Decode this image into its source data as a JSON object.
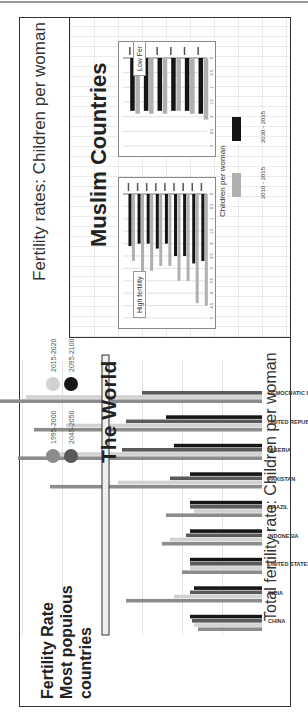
{
  "slide": {
    "right_title": "Fertility rates: Children per woman",
    "left_title_lines": [
      "Fertility Rate",
      "Most    populous",
      "countries"
    ],
    "world_title": "The World",
    "bottom_label": "Total fertility rate: Children per woman"
  },
  "muslim_panel": {
    "title": "Muslim Countries",
    "high_tag": "High fertility",
    "low_tag": "Low Fer",
    "legend_title": "Children per woman",
    "legend": [
      {
        "label": "2010 - 2015",
        "color": "#b0b0b0"
      },
      {
        "label": "2030 - 2035",
        "color": "#141414"
      }
    ]
  },
  "chart_data": [
    {
      "type": "bar",
      "title": "The World",
      "ylabel": "Total fertility rate: Children per woman",
      "ylim": [
        0,
        7
      ],
      "grid": true,
      "legend_position": "top-left",
      "categories": [
        "CHINA",
        "INDIA",
        "UNITED STATES",
        "INDONESIA",
        "BRAZIL",
        "PAKISTAN",
        "NIGERIA",
        "UNITED REPUBLIC OF TANZANIA",
        "DEMOCRATIC REPUBLIC OF THE CONGO"
      ],
      "series": [
        {
          "name": "1995-2000",
          "color": "#8c8c8c",
          "values": [
            1.6,
            3.4,
            2.0,
            2.5,
            2.4,
            5.3,
            6.1,
            5.7,
            6.7
          ]
        },
        {
          "name": "2015-2020",
          "color": "#d2d2d2",
          "values": [
            1.7,
            2.2,
            1.8,
            2.3,
            1.7,
            3.6,
            5.4,
            4.9,
            5.9
          ]
        },
        {
          "name": "2045-2050",
          "color": "#5a5a5a",
          "values": [
            1.75,
            1.8,
            1.8,
            1.9,
            1.8,
            2.3,
            3.5,
            3.4,
            3.0
          ]
        },
        {
          "name": "2095-2100",
          "color": "#161616",
          "values": [
            1.8,
            1.7,
            1.8,
            1.8,
            1.8,
            1.8,
            2.2,
            2.4,
            null
          ]
        }
      ],
      "highlight_value": 3.9
    },
    {
      "type": "bar",
      "title": "High fertility",
      "orientation": "horizontal",
      "xlim": [
        0,
        5
      ],
      "ticks": [
        "0",
        "0.5",
        "1",
        "1.5",
        "2",
        "2.5",
        "3",
        "3.5",
        "4",
        "4.5",
        "5"
      ],
      "series": [
        {
          "name": "2010 - 2015",
          "values": [
            2.7,
            3.1,
            3.1,
            2.9,
            2.9,
            3.5,
            3.5,
            4.4,
            4.5
          ]
        },
        {
          "name": "2030 - 2035",
          "values": [
            2.1,
            2.0,
            2.0,
            2.2,
            2.0,
            2.5,
            2.5,
            2.8,
            2.7
          ]
        }
      ]
    },
    {
      "type": "bar",
      "title": "Low Fertility",
      "orientation": "horizontal",
      "xlim": [
        0,
        3
      ],
      "ticks": [
        "0",
        "0.5",
        "1",
        "1.5",
        "2",
        "2.5",
        "3"
      ],
      "series": [
        {
          "name": "2010 - 2015",
          "values": [
            1.9,
            1.9,
            1.9,
            1.8,
            1.9,
            2.1
          ]
        },
        {
          "name": "2030 - 2035",
          "values": [
            1.8,
            1.8,
            1.8,
            1.8,
            1.8,
            1.9
          ]
        }
      ]
    }
  ]
}
